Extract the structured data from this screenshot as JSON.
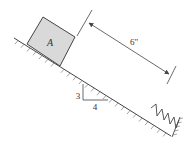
{
  "diagram": {
    "type": "mechanics-incline",
    "block": {
      "label": "A",
      "fill": "#d9d9d9",
      "stroke": "#444444"
    },
    "dimension": {
      "label": "6\""
    },
    "slope": {
      "rise_label": "3",
      "run_label": "4"
    },
    "spring": {
      "name": "spring"
    },
    "colors": {
      "line": "#444444",
      "background": "#ffffff"
    }
  }
}
